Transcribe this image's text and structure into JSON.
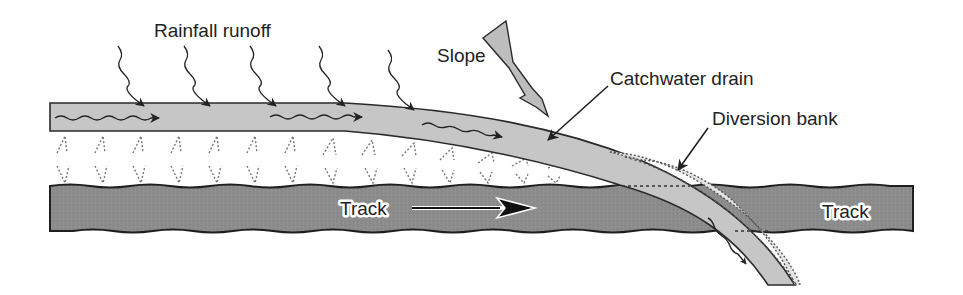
{
  "diagram": {
    "labels": {
      "rainfall": "Rainfall runoff",
      "slope": "Slope",
      "catchwater": "Catchwater drain",
      "diversion": "Diversion bank",
      "track_left": "Track",
      "track_right": "Track"
    },
    "colors": {
      "drain_fill": "#c4c4c4",
      "track_fill": "#8a8a8a",
      "outline": "#222222",
      "bank_fill": "#e2e2e2",
      "slope_arrow_fill": "#bdbdbd",
      "text": "#222222"
    },
    "rainfall_arrow_count": 5,
    "vegetation_rows": 2
  }
}
